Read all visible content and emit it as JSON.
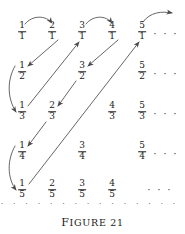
{
  "figure": {
    "caption_first_letter": "F",
    "caption_rest": "IGURE",
    "caption_number": "21",
    "caption_full": "FIGURE 21",
    "ink_color": "#1a1a1a",
    "arrow_color": "#4a4a4a",
    "background_color": "#ffffff"
  },
  "grid": {
    "description": "Array of positive rational numbers arranged by numerator (column) and denominator (row); non-reduced duplicates are omitted",
    "column_x": [
      22,
      52,
      82,
      112,
      142
    ],
    "row_y": [
      32,
      72,
      112,
      152,
      190
    ],
    "ellipsis_glyph": "· · ·",
    "cells": [
      {
        "num": "1",
        "den": "1",
        "col": 0,
        "row": 0,
        "x": 22,
        "y": 32
      },
      {
        "num": "2",
        "den": "1",
        "col": 1,
        "row": 0,
        "x": 52,
        "y": 32
      },
      {
        "num": "3",
        "den": "1",
        "col": 2,
        "row": 0,
        "x": 82,
        "y": 32
      },
      {
        "num": "4",
        "den": "1",
        "col": 3,
        "row": 0,
        "x": 112,
        "y": 32
      },
      {
        "num": "5",
        "den": "1",
        "col": 4,
        "row": 0,
        "x": 142,
        "y": 32
      },
      {
        "num": "1",
        "den": "2",
        "col": 0,
        "row": 1,
        "x": 22,
        "y": 72
      },
      {
        "num": "3",
        "den": "2",
        "col": 2,
        "row": 1,
        "x": 82,
        "y": 72
      },
      {
        "num": "5",
        "den": "2",
        "col": 4,
        "row": 1,
        "x": 142,
        "y": 72
      },
      {
        "num": "1",
        "den": "3",
        "col": 0,
        "row": 2,
        "x": 22,
        "y": 112
      },
      {
        "num": "2",
        "den": "3",
        "col": 1,
        "row": 2,
        "x": 52,
        "y": 112
      },
      {
        "num": "4",
        "den": "3",
        "col": 3,
        "row": 2,
        "x": 112,
        "y": 112
      },
      {
        "num": "5",
        "den": "3",
        "col": 4,
        "row": 2,
        "x": 142,
        "y": 112
      },
      {
        "num": "1",
        "den": "4",
        "col": 0,
        "row": 3,
        "x": 22,
        "y": 152
      },
      {
        "num": "3",
        "den": "4",
        "col": 2,
        "row": 3,
        "x": 82,
        "y": 152
      },
      {
        "num": "5",
        "den": "4",
        "col": 4,
        "row": 3,
        "x": 142,
        "y": 152
      },
      {
        "num": "1",
        "den": "5",
        "col": 0,
        "row": 4,
        "x": 22,
        "y": 190
      },
      {
        "num": "2",
        "den": "5",
        "col": 1,
        "row": 4,
        "x": 52,
        "y": 190
      },
      {
        "num": "3",
        "den": "5",
        "col": 2,
        "row": 4,
        "x": 82,
        "y": 190
      },
      {
        "num": "4",
        "den": "5",
        "col": 3,
        "row": 4,
        "x": 112,
        "y": 190
      }
    ],
    "row_ellipses": [
      {
        "row": 0,
        "x": 166,
        "y": 34
      },
      {
        "row": 1,
        "x": 166,
        "y": 74
      },
      {
        "row": 2,
        "x": 166,
        "y": 114
      },
      {
        "row": 3,
        "x": 166,
        "y": 154
      },
      {
        "row": 4,
        "x": 160,
        "y": 190
      }
    ],
    "bottom_ellipsis_row": {
      "x": 96,
      "y": 204,
      "glyph": "· · · · · · · · · · · · · · · · · · · · · ·"
    }
  },
  "path": {
    "description": "Zig-zag enumeration path visiting every positive rational exactly once",
    "segments": [
      {
        "id": "a1",
        "kind": "curve-over",
        "from": "1/1",
        "to": "2/1",
        "d": "M 25 24 C 32 15, 46 15, 52 23"
      },
      {
        "id": "a2",
        "kind": "diagonal-down",
        "from": "2/1",
        "to": "1/2",
        "d": "M 58 40 L 28 66"
      },
      {
        "id": "a3",
        "kind": "curve-left-down",
        "from": "1/2",
        "to": "1/3",
        "d": "M 15 66 C 7 80, 7 98, 16 112"
      },
      {
        "id": "a4",
        "kind": "diagonal-up",
        "from": "1/3",
        "to": "3/1",
        "d": "M 28 106 L 79 42"
      },
      {
        "id": "a5",
        "kind": "curve-over",
        "from": "3/1",
        "to": "4/1",
        "d": "M 86 24 C 93 15, 106 15, 112 23"
      },
      {
        "id": "a6",
        "kind": "diagonal-down",
        "from": "4/1",
        "to": "3/2",
        "d": "M 118 40 L 88 66"
      },
      {
        "id": "a7",
        "kind": "diagonal-down",
        "from": "3/2",
        "to": "2/3",
        "d": "M 76 81 L 58 106"
      },
      {
        "id": "a8",
        "kind": "diagonal-down",
        "from": "2/3",
        "to": "1/4",
        "d": "M 46 122 L 28 146"
      },
      {
        "id": "a9",
        "kind": "curve-left-down",
        "from": "1/4",
        "to": "1/5",
        "d": "M 15 146 C 7 160, 7 178, 16 190"
      },
      {
        "id": "a10",
        "kind": "diagonal-up",
        "from": "1/5",
        "to": "5/1",
        "d": "M 29 184 L 139 42"
      },
      {
        "id": "a11",
        "kind": "curve-exit",
        "from": "5/1",
        "to": "→",
        "d": "M 143 22 C 150 12, 162 11, 172 13"
      }
    ]
  }
}
